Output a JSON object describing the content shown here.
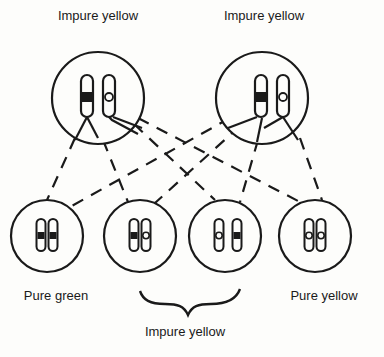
{
  "diagram": {
    "type": "genetic-cross",
    "parents": [
      {
        "id": "parent-left",
        "label": "Impure yellow",
        "chromosomes": [
          "dark",
          "light"
        ]
      },
      {
        "id": "parent-right",
        "label": "Impure yellow",
        "chromosomes": [
          "dark",
          "light"
        ]
      }
    ],
    "offspring": [
      {
        "id": "offspring-1",
        "chromosomes": [
          "dark",
          "dark"
        ],
        "label": "Pure green"
      },
      {
        "id": "offspring-2",
        "chromosomes": [
          "dark",
          "light"
        ]
      },
      {
        "id": "offspring-3",
        "chromosomes": [
          "light",
          "dark"
        ]
      },
      {
        "id": "offspring-4",
        "chromosomes": [
          "light",
          "light"
        ],
        "label": "Pure yellow"
      }
    ],
    "group_label": "Impure yellow",
    "colors": {
      "line": "#1a1a1a",
      "background": "#fdfdfb"
    }
  }
}
